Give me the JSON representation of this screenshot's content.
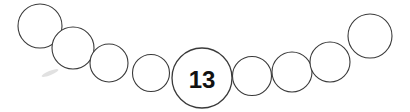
{
  "canvas": {
    "width": 410,
    "height": 112,
    "background_color": "#ffffff"
  },
  "diagram": {
    "name": "circle-chain",
    "stroke_color": "#3a3a3a",
    "fill_color": "#ffffff",
    "label_color": "#121212",
    "nodes": [
      {
        "id": "circle-1",
        "label": "",
        "cx": 40,
        "cy": 26,
        "r": 22.0
      },
      {
        "id": "circle-2",
        "label": "",
        "cx": 73,
        "cy": 48,
        "r": 21.0
      },
      {
        "id": "circle-3",
        "label": "",
        "cx": 109,
        "cy": 63,
        "r": 19.0
      },
      {
        "id": "circle-4",
        "label": "",
        "cx": 151,
        "cy": 73,
        "r": 18.5
      },
      {
        "id": "circle-5",
        "label": "13",
        "cx": 202,
        "cy": 78,
        "r": 30.0,
        "font_size": 24
      },
      {
        "id": "circle-6",
        "label": "",
        "cx": 252,
        "cy": 76,
        "r": 19.5
      },
      {
        "id": "circle-7",
        "label": "",
        "cx": 292,
        "cy": 72,
        "r": 20.0
      },
      {
        "id": "circle-8",
        "label": "",
        "cx": 330,
        "cy": 62,
        "r": 20.0
      },
      {
        "id": "circle-9",
        "label": "",
        "cx": 370,
        "cy": 36,
        "r": 22.0
      }
    ],
    "artifacts": [
      {
        "id": "smudge-1",
        "cx": 50,
        "cy": 73,
        "rx": 9,
        "ry": 2.2,
        "rotate": -22
      }
    ]
  }
}
